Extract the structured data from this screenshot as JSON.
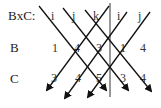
{
  "diagram": {
    "title_label": "BxC:",
    "row_labels": {
      "b": "B",
      "c": "C"
    },
    "header": [
      "i",
      "j",
      "k",
      "i",
      "j"
    ],
    "b_values": [
      "1",
      "4",
      "3",
      "1",
      "4"
    ],
    "c_values": [
      "3",
      "4",
      "5",
      "3",
      "4"
    ],
    "arrows": {
      "down_right_count": 3,
      "down_left_count": 3,
      "color": "#111111"
    },
    "separator": "vertical-line"
  }
}
